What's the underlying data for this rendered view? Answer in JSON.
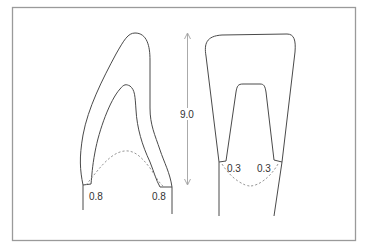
{
  "diagram": {
    "type": "dental tooth preparation cross-section",
    "colors": {
      "frame": "#9a9a9a",
      "outline": "#4a4a4a",
      "dashed": "#8a8a8a",
      "arrow": "#a0a0a0",
      "label": "#333333"
    },
    "height_dimension": {
      "label": "9.0"
    },
    "left_tooth": {
      "view": "side / proximal",
      "margin_left_label": "0.8",
      "margin_right_label": "0.8"
    },
    "right_tooth": {
      "view": "facial / front",
      "margin_left_label": "0.3",
      "margin_right_label": "0.3"
    }
  }
}
